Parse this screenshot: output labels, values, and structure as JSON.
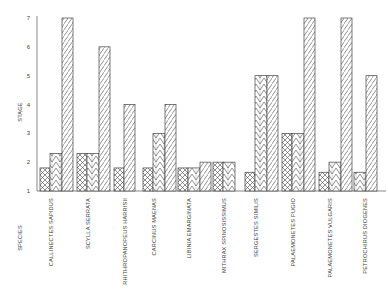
{
  "chart_data": {
    "type": "bar",
    "title": "",
    "xlabel": "SPECIES",
    "ylabel": "STAGE",
    "ylim": [
      1,
      7
    ],
    "yticks": [
      1,
      2,
      3,
      4,
      5,
      6,
      7
    ],
    "grid": false,
    "legend": null,
    "categories": [
      "CALLINECTES SAPIDUS",
      "SCYLLA SERRATA",
      "RHITHROPANOPEUS HARRISII",
      "CARCINUS MAENAS",
      "LIBINIA EMARGINATA",
      "MITHRAX SPINOSISSIMUS",
      "SERGESTES SIMILIS",
      "PALAEMONETES PUGIO",
      "PALAEMONETES VULGARIS",
      "PETROCHIRUS DIOGENES"
    ],
    "series": [
      {
        "name": "cross-hatched",
        "pattern": "crosshatch",
        "values": [
          1.8,
          2.3,
          1.8,
          1.8,
          1.8,
          2.0,
          1.65,
          3.0,
          1.65,
          null
        ]
      },
      {
        "name": "chevron",
        "pattern": "chevron",
        "values": [
          2.3,
          2.3,
          null,
          3.0,
          1.8,
          2.0,
          5.0,
          3.0,
          2.0,
          1.65
        ]
      },
      {
        "name": "diagonal",
        "pattern": "diagonal",
        "values": [
          7.0,
          6.0,
          4.0,
          4.0,
          2.0,
          null,
          5.0,
          7.0,
          7.0,
          5.0
        ]
      }
    ]
  }
}
